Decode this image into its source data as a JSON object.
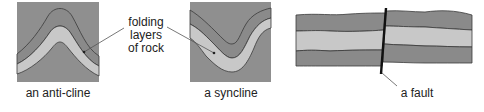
{
  "colors": {
    "background": "#8e8e8e",
    "dark_layer": "#8a8a8a",
    "light_layer": "#c8c8c8",
    "layer_outline": "#3a3a3a",
    "fault_line": "#111111",
    "leader_line": "#555555"
  },
  "labels": {
    "anticline": "an anti-cline",
    "syncline": "a syncline",
    "fault": "a fault",
    "folding_line1": "folding",
    "folding_line2": "layers",
    "folding_line3": "of rock"
  }
}
